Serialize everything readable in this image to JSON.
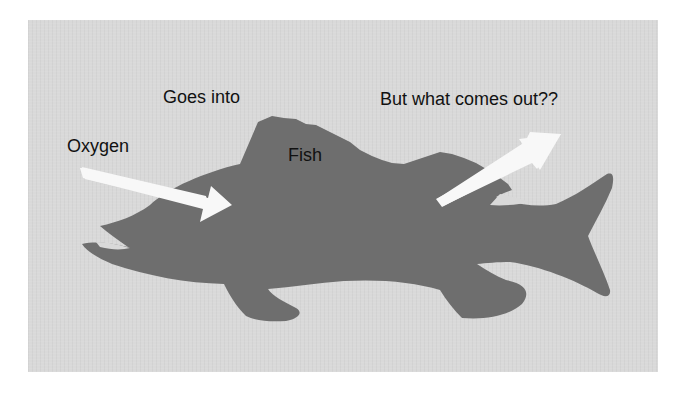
{
  "diagram": {
    "labels": {
      "goes_into": "Goes into",
      "oxygen": "Oxygen",
      "fish": "Fish",
      "question": "But what comes out??"
    },
    "arrows": [
      {
        "name": "oxygen-in-arrow",
        "direction": "into fish",
        "meaning": "Oxygen goes into fish"
      },
      {
        "name": "output-arrow",
        "direction": "out of fish",
        "meaning": "What comes out?"
      }
    ],
    "colors": {
      "background": "#d9d9d9",
      "fish": "#6e6e6e",
      "arrow": "#f8f8f8",
      "text": "#111111"
    }
  }
}
